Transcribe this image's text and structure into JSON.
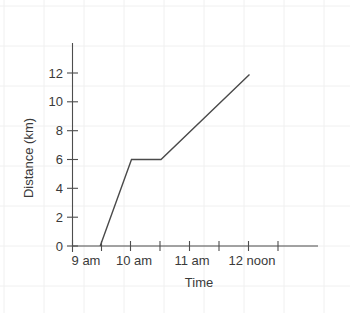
{
  "chart_data": {
    "type": "line",
    "title": "",
    "xlabel": "Time",
    "ylabel": "Distance (km)",
    "x_tick_labels": [
      "9 am",
      "10 am",
      "11 am",
      "12 noon"
    ],
    "x_tick_values": [
      9,
      10,
      11,
      12
    ],
    "x_minor_ticks": [
      9.5,
      10.5,
      11.5,
      12.5
    ],
    "xlim": [
      9,
      12.7
    ],
    "y_tick_labels": [
      "0",
      "2",
      "4",
      "6",
      "8",
      "10",
      "12"
    ],
    "y_tick_values": [
      0,
      2,
      4,
      6,
      8,
      10,
      12
    ],
    "ylim": [
      0,
      14
    ],
    "grid": "faint-background-graph-paper",
    "legend": "none",
    "series": [
      {
        "name": "journey",
        "x": [
          9.47,
          10.0,
          10.5,
          12.0
        ],
        "y": [
          0,
          6,
          6,
          11.9
        ],
        "points": [
          {
            "time": "9:28 am",
            "distance_km": 0
          },
          {
            "time": "10 am",
            "distance_km": 6
          },
          {
            "time": "10:30 am",
            "distance_km": 6
          },
          {
            "time": "12 noon",
            "distance_km": 11.9
          }
        ]
      }
    ],
    "colors": {
      "line": "#4a4a4a",
      "axis": "#4d4d4d",
      "text": "#3a3a3a",
      "grid": "#eeeeee",
      "background": "#ffffff"
    }
  }
}
